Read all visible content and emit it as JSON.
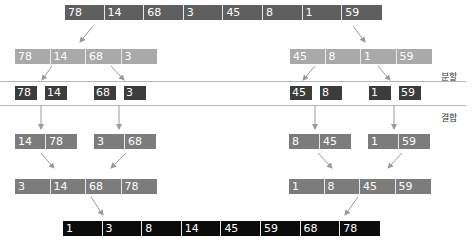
{
  "diagram": {
    "labels": {
      "split": "분할",
      "merge": "결합"
    },
    "input": [
      "78",
      "14",
      "68",
      "3",
      "45",
      "8",
      "1",
      "59"
    ],
    "split_halves": {
      "left": [
        "78",
        "14",
        "68",
        "3"
      ],
      "right": [
        "45",
        "8",
        "1",
        "59"
      ]
    },
    "singletons": [
      "78",
      "14",
      "68",
      "3",
      "45",
      "8",
      "1",
      "59"
    ],
    "merged_pairs": {
      "p1": [
        "14",
        "78"
      ],
      "p2": [
        "3",
        "68"
      ],
      "p3": [
        "8",
        "45"
      ],
      "p4": [
        "1",
        "59"
      ]
    },
    "merged_halves": {
      "left": [
        "3",
        "14",
        "68",
        "78"
      ],
      "right": [
        "1",
        "8",
        "45",
        "59"
      ]
    },
    "output": [
      "1",
      "3",
      "8",
      "14",
      "45",
      "59",
      "68",
      "78"
    ],
    "colors": {
      "input": "#5f5f5f",
      "split_half": "#a9a9a9",
      "singleton": "#3c3c3c",
      "merged": "#7c7c7c",
      "output": "#0b0b0b",
      "arrow": "#999999",
      "divider": "#b5b5b5"
    }
  }
}
